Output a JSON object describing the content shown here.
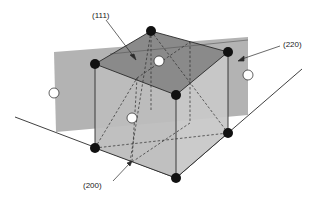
{
  "diagram": {
    "type": "fcc-unit-cell-crystal-planes",
    "labels": {
      "plane_111": "(111)",
      "plane_220": "(220)",
      "plane_200": "(200)"
    },
    "colors": {
      "background": "#ffffff",
      "plane_220_fill": "#b3b3b3",
      "cube_left_face": "#bdbdbd",
      "cube_right_face": "#c8c8c8",
      "plane_111_fill": "#8a8a8a",
      "edge": "#2a2a2a",
      "corner_atom": "#111111",
      "face_atom": "#ffffff"
    },
    "atoms": {
      "corner_count": 7,
      "face_center_visible": 4
    }
  }
}
